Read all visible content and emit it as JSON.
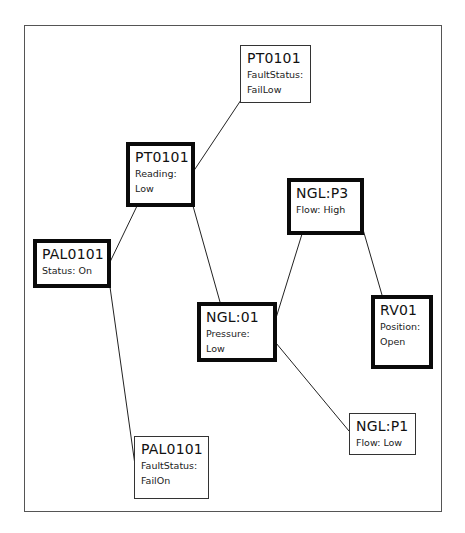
{
  "diagram": {
    "nodes": [
      {
        "id": "pt0101_fault",
        "title": "PT0101",
        "line1": "FaultStatus:",
        "line2": "FailLow",
        "emphasis": "thin"
      },
      {
        "id": "pt0101_reading",
        "title": "PT0101",
        "line1": "Reading:",
        "line2": "Low",
        "emphasis": "thick"
      },
      {
        "id": "pal0101_status",
        "title": "PAL0101",
        "line1": "Status: On",
        "line2": "",
        "emphasis": "thick"
      },
      {
        "id": "nglp3",
        "title": "NGL:P3",
        "line1": "Flow: High",
        "line2": "",
        "emphasis": "thick"
      },
      {
        "id": "ngl01",
        "title": "NGL:01",
        "line1": "Pressure:",
        "line2": "Low",
        "emphasis": "thick"
      },
      {
        "id": "rv01",
        "title": "RV01",
        "line1": "Position:",
        "line2": "Open",
        "emphasis": "thick"
      },
      {
        "id": "nglp1",
        "title": "NGL:P1",
        "line1": "Flow: Low",
        "line2": "",
        "emphasis": "thin"
      },
      {
        "id": "pal0101_fault",
        "title": "PAL0101",
        "line1": "FaultStatus:",
        "line2": "FailOn",
        "emphasis": "thin"
      }
    ],
    "edges": [
      {
        "from": "pt0101_reading",
        "to": "pt0101_fault"
      },
      {
        "from": "pal0101_status",
        "to": "pt0101_reading"
      },
      {
        "from": "pt0101_reading",
        "to": "ngl01"
      },
      {
        "from": "pal0101_status",
        "to": "pal0101_fault"
      },
      {
        "from": "ngl01",
        "to": "nglp3"
      },
      {
        "from": "nglp3",
        "to": "rv01"
      },
      {
        "from": "ngl01",
        "to": "nglp1"
      }
    ]
  }
}
